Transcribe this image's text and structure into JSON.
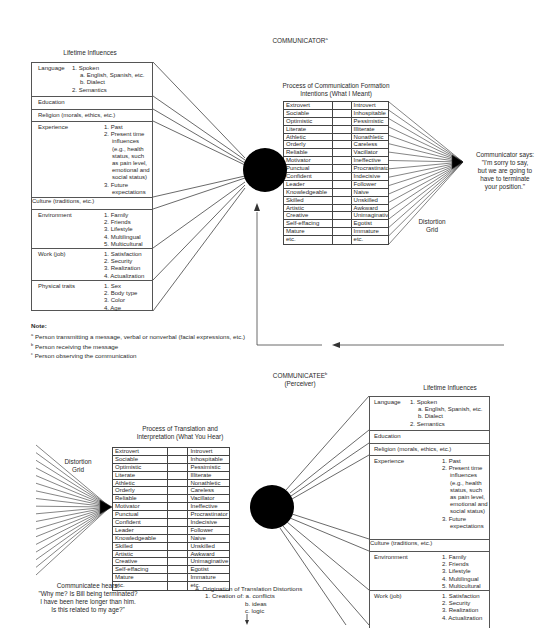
{
  "communicator": {
    "title": "COMMUNICATOR",
    "title_sup": "a",
    "lifetime_influences": {
      "heading": "Lifetime Influences",
      "rows": [
        {
          "label": "Language",
          "items": [
            "1. Spoken",
            "a. English, Spanish, etc.",
            "b. Dialect",
            "2. Semantics"
          ]
        },
        {
          "label": "Education",
          "items": []
        },
        {
          "label": "Religion (morals, ethics, etc.)",
          "items": []
        },
        {
          "label": "Experience",
          "items": [
            "1. Past",
            "2. Present time",
            "influences",
            "(e.g., health",
            "status, such",
            "as pain level,",
            "emotional and",
            "social status)",
            "3. Future",
            "expectations"
          ]
        },
        {
          "label": "Culture (traditions, etc.)",
          "items": []
        },
        {
          "label": "Environment",
          "items": [
            "1. Family",
            "2. Friends",
            "3. Lifestyle",
            "4. Multilingual",
            "5. Multicultural"
          ]
        },
        {
          "label": "Work (job)",
          "items": [
            "1. Satisfaction",
            "2. Security",
            "3. Realization",
            "4. Actualization"
          ]
        },
        {
          "label": "Physical traits",
          "items": [
            "1. Sex",
            "2. Body type",
            "3. Color",
            "4. Age"
          ]
        }
      ]
    },
    "process": {
      "heading_line1": "Process of Communication Formation",
      "heading_line2": "Intentions (What I Meant)",
      "rows": [
        [
          "Extrovert",
          "Introvert"
        ],
        [
          "Sociable",
          "Inhospitable"
        ],
        [
          "Optimistic",
          "Pessimistic"
        ],
        [
          "Literate",
          "Illiterate"
        ],
        [
          "Athletic",
          "Nonathletic"
        ],
        [
          "Orderly",
          "Careless"
        ],
        [
          "Reliable",
          "Vacillator"
        ],
        [
          "Motivator",
          "Ineffective"
        ],
        [
          "Punctual",
          "Procrastinator"
        ],
        [
          "Confident",
          "Indecisive"
        ],
        [
          "Leader",
          "Follower"
        ],
        [
          "Knowledgeable",
          "Naive"
        ],
        [
          "Skilled",
          "Unskilled"
        ],
        [
          "Artistic",
          "Awkward"
        ],
        [
          "Creative",
          "Unimaginative"
        ],
        [
          "Self-effacing",
          "Egotist"
        ],
        [
          "Mature",
          "Immature"
        ],
        [
          "etc.",
          "etc."
        ]
      ]
    },
    "distortion_grid_label_1": "Distortion",
    "distortion_grid_label_2": "Grid",
    "says": [
      "Communicator says:",
      "\"I'm sorry to say,",
      "but we are going to",
      "have to terminate",
      "your position.\""
    ]
  },
  "note": {
    "heading": "Note:",
    "items": [
      {
        "sup": "a",
        "text": "Person transmitting a message, verbal or nonverbal (facial expressions, etc.)"
      },
      {
        "sup": "b",
        "text": "Person receiving the message"
      },
      {
        "sup": "c",
        "text": "Person observing the communication"
      }
    ]
  },
  "communicatee": {
    "title": "COMMUNICATEE",
    "title_sup": "b",
    "subtitle": "(Perceiver)",
    "lifetime_influences": {
      "heading": "Lifetime Influences",
      "rows": [
        {
          "label": "Language",
          "items": [
            "1. Spoken",
            "a. English, Spanish, etc.",
            "b. Dialect",
            "2. Semantics"
          ]
        },
        {
          "label": "Education",
          "items": []
        },
        {
          "label": "Religion (morals, ethics, etc.)",
          "items": []
        },
        {
          "label": "Experience",
          "items": [
            "1. Past",
            "2. Present time",
            "influences",
            "(e.g., health",
            "status, such",
            "as pain level,",
            "emotional and",
            "social status)",
            "3. Future",
            "expectations"
          ]
        },
        {
          "label": "Culture (traditions, etc.)",
          "items": []
        },
        {
          "label": "Environment",
          "items": [
            "1. Family",
            "2. Friends",
            "3. Lifestyle",
            "4. Multilingual",
            "5. Multicultural"
          ]
        },
        {
          "label": "Work (job)",
          "items": [
            "1. Satisfaction",
            "2. Security",
            "3. Realization",
            "4. Actualization"
          ]
        }
      ]
    },
    "process": {
      "heading_line1": "Process of Translation and",
      "heading_line2": "Interpretation (What You Hear)",
      "rows": [
        [
          "Extrovert",
          "Introvert"
        ],
        [
          "Sociable",
          "Inhospitable"
        ],
        [
          "Optimistic",
          "Pessimistic"
        ],
        [
          "Literate",
          "Illiterate"
        ],
        [
          "Athletic",
          "Nonathletic"
        ],
        [
          "Orderly",
          "Careless"
        ],
        [
          "Reliable",
          "Vacillator"
        ],
        [
          "Motivator",
          "Ineffective"
        ],
        [
          "Punctual",
          "Procrastinator"
        ],
        [
          "Confident",
          "Indecisive"
        ],
        [
          "Leader",
          "Follower"
        ],
        [
          "Knowledgeable",
          "Naive"
        ],
        [
          "Skilled",
          "Unskilled"
        ],
        [
          "Artistic",
          "Awkward"
        ],
        [
          "Creative",
          "Unimaginative"
        ],
        [
          "Self-effacing",
          "Egotist"
        ],
        [
          "Mature",
          "Immature"
        ],
        [
          "etc.",
          "etc."
        ]
      ]
    },
    "distortion_grid_label_1": "Distortion",
    "distortion_grid_label_2": "Grid",
    "hears": [
      "Communicatee hears:",
      "\"Why me? Is Bill being terminated?",
      "I have been here longer than him.",
      "Is this related to my age?\""
    ],
    "origination": {
      "line1": "A. Origination of Translation Distortions",
      "line2": "1. Creation of: a. conflicts",
      "line3": "b. ideas",
      "line4": "c. logic"
    }
  }
}
